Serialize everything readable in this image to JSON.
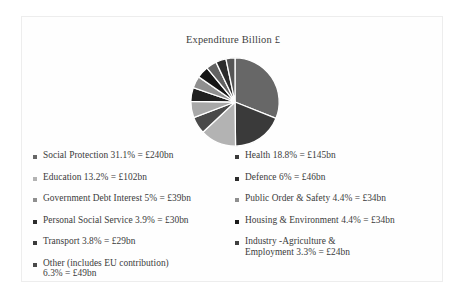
{
  "chart": {
    "title": "Expenditure Billion £"
  },
  "chart_data": {
    "type": "pie",
    "title": "Expenditure Billion £",
    "xlabel": "",
    "ylabel": "",
    "unit": "£bn",
    "legend_position": "bottom",
    "grid": false,
    "total_value": 852,
    "categories": [
      "Social Protection",
      "Health",
      "Education",
      "Other (includes EU contribution)",
      "Defence",
      "Government Debt Interest",
      "Public Order & Safety",
      "Housing & Environment",
      "Personal Social Service",
      "Transport",
      "Industry -Agriculture & Employment"
    ],
    "values": [
      240,
      145,
      102,
      49,
      46,
      39,
      34,
      34,
      30,
      29,
      24
    ],
    "percents": [
      31.1,
      18.8,
      13.2,
      6.3,
      6,
      5,
      4.4,
      4.4,
      3.9,
      3.8,
      3.3
    ],
    "colors": [
      "#676767",
      "#3a3a3a",
      "#b3b3b3",
      "#4a4a4a",
      "#a8a8a8",
      "#202020",
      "#8f8f8f",
      "#161616",
      "#626262",
      "#2c2c2c",
      "#555555"
    ],
    "slices": [
      {
        "label": "Social Protection",
        "percent": 31.1,
        "value": 240,
        "color": "#676767"
      },
      {
        "label": "Health",
        "percent": 18.8,
        "value": 145,
        "color": "#3a3a3a"
      },
      {
        "label": "Education",
        "percent": 13.2,
        "value": 102,
        "color": "#b3b3b3"
      },
      {
        "label": "Other (includes EU contribution)",
        "percent": 6.3,
        "value": 49,
        "color": "#4a4a4a"
      },
      {
        "label": "Defence",
        "percent": 6,
        "value": 46,
        "color": "#a8a8a8"
      },
      {
        "label": "Government Debt Interest",
        "percent": 5,
        "value": 39,
        "color": "#202020"
      },
      {
        "label": "Public Order & Safety",
        "percent": 4.4,
        "value": 34,
        "color": "#8f8f8f"
      },
      {
        "label": "Housing & Environment",
        "percent": 4.4,
        "value": 34,
        "color": "#161616"
      },
      {
        "label": "Personal Social Service",
        "percent": 3.9,
        "value": 30,
        "color": "#626262"
      },
      {
        "label": "Transport",
        "percent": 3.8,
        "value": 29,
        "color": "#2c2c2c"
      },
      {
        "label": "Industry -Agriculture & Employment",
        "percent": 3.3,
        "value": 24,
        "color": "#555555"
      }
    ]
  },
  "legend": {
    "left_column": [
      {
        "text": "Social Protection 31.1% = £240bn",
        "color": "#676767"
      },
      {
        "text": "Education 13.2% = £102bn",
        "color": "#b3b3b3"
      },
      {
        "text": "Government Debt Interest 5% = £39bn",
        "color": "#8f8f8f"
      },
      {
        "text": "Personal Social Service 3.9% = £30bn",
        "color": "#2c2c2c"
      },
      {
        "text": "Transport 3.8% = £29bn",
        "color": "#3a3a3a"
      },
      {
        "text": "Other (includes EU contribution)\n6.3% = £49bn",
        "color": "#4a4a4a"
      }
    ],
    "right_column": [
      {
        "text": "Health 18.8% = £145bn",
        "color": "#3a3a3a"
      },
      {
        "text": "Defence 6% = £46bn",
        "color": "#2c2c2c"
      },
      {
        "text": "Public Order & Safety 4.4% = £34bn",
        "color": "#8f8f8f"
      },
      {
        "text": "Housing & Environment 4.4% = £34bn",
        "color": "#1b1b1b"
      },
      {
        "text": "Industry -Agriculture &\n   Employment 3.3% = £24bn",
        "color": "#404040"
      }
    ]
  }
}
